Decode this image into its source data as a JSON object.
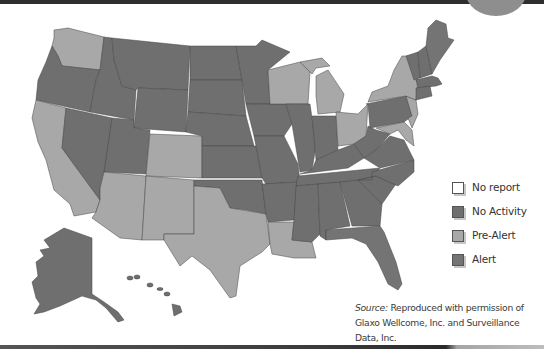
{
  "colors": {
    "no_report": "#ffffff",
    "no_activity": "#6f6f6f",
    "pre_alert": "#a8a8a8",
    "alert": "#747474",
    "border": "#444444"
  },
  "legend": {
    "items": [
      {
        "key": "no_report",
        "label": "No report",
        "color": "#ffffff"
      },
      {
        "key": "no_activity",
        "label": "No Activity",
        "color": "#6f6f6f"
      },
      {
        "key": "pre_alert",
        "label": "Pre-Alert",
        "color": "#a8a8a8"
      },
      {
        "key": "alert",
        "label": "Alert",
        "color": "#747474"
      }
    ]
  },
  "source": {
    "prefix": "Source:",
    "line1": " Reproduced with permission of",
    "line2": "Glaxo Wellcome, Inc. and Surveillance Data, Inc."
  },
  "map": {
    "region": "United States",
    "pre_alert_states": [
      "Washington",
      "California",
      "Arizona",
      "New Mexico",
      "Colorado",
      "Texas",
      "Louisiana",
      "Wisconsin",
      "Michigan",
      "Ohio",
      "New York",
      "New Jersey",
      "Delaware",
      "Maryland"
    ],
    "dark_states": [
      "Oregon",
      "Idaho",
      "Montana",
      "Nevada",
      "Utah",
      "Wyoming",
      "North Dakota",
      "South Dakota",
      "Nebraska",
      "Kansas",
      "Oklahoma",
      "Minnesota",
      "Iowa",
      "Missouri",
      "Arkansas",
      "Illinois",
      "Indiana",
      "Kentucky",
      "Tennessee",
      "Mississippi",
      "Alabama",
      "Georgia",
      "Florida",
      "South Carolina",
      "North Carolina",
      "Virginia",
      "West Virginia",
      "Pennsylvania",
      "Vermont",
      "New Hampshire",
      "Maine",
      "Massachusetts",
      "Connecticut",
      "Rhode Island",
      "Alaska",
      "Hawaii"
    ]
  }
}
